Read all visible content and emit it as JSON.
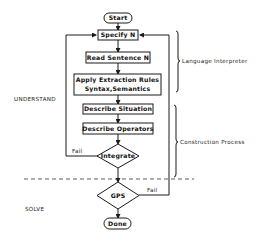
{
  "diagram": {
    "nodes": {
      "start": "Start",
      "specify": "Specify N",
      "read": "Read Sentence N",
      "apply_line1": "Apply Extraction Rules",
      "apply_line2": "Syntax,Semantics",
      "situation": "Describe Situation",
      "operators": "Describe Operators",
      "integrate": "Integrate",
      "gps": "GPS",
      "done": "Done"
    },
    "edge_labels": {
      "integrate_fail": "Fail",
      "gps_fail": "Fail"
    },
    "brackets": {
      "language": "Language Interpreter",
      "construction": "Construction Process"
    },
    "phases": {
      "understand": "UNDERSTAND",
      "solve": "SOLVE"
    }
  }
}
